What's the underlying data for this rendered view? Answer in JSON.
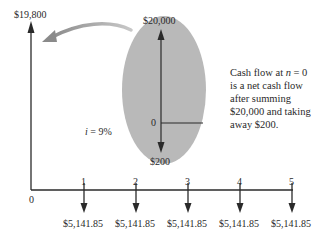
{
  "diagram": {
    "type": "cash-flow-diagram",
    "interest_rate_label": "i = 9%",
    "interest_symbol": "i",
    "interest_value": "= 9%",
    "origin_label": "0",
    "net_inflow": {
      "period": 0,
      "label": "$19,800",
      "amount": 19800,
      "direction": "up"
    },
    "periods": [
      {
        "n": "1",
        "label": "$5,141.85",
        "amount": -5141.85
      },
      {
        "n": "2",
        "label": "$5,141.85",
        "amount": -5141.85
      },
      {
        "n": "3",
        "label": "$5,141.85",
        "amount": -5141.85
      },
      {
        "n": "4",
        "label": "$5,141.85",
        "amount": -5141.85
      },
      {
        "n": "5",
        "label": "$5,141.85",
        "amount": -5141.85
      }
    ],
    "callout": {
      "top_label": "$20,000",
      "zero_label": "0",
      "bottom_label": "$200",
      "fill_color": "#b9b9b9"
    },
    "note": {
      "line1_a": "Cash flow at ",
      "line1_n": "n",
      "line1_b": " = 0",
      "line2": "is a net cash flow",
      "line3": "after summing",
      "line4": "$20,000 and taking",
      "line5": "away $200."
    },
    "colors": {
      "line": "#2a2a2a",
      "ellipse": "#b9b9b9",
      "curved_arrow": "#9a9a9a"
    }
  }
}
